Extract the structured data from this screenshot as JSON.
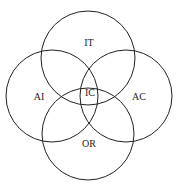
{
  "diagram": {
    "type": "venn",
    "sets": [
      {
        "id": "top",
        "label": "IT",
        "cx": 88,
        "cy": 58,
        "r": 47
      },
      {
        "id": "left",
        "label": "AI",
        "cx": 52,
        "cy": 96,
        "r": 46
      },
      {
        "id": "right",
        "label": "AC",
        "cx": 126,
        "cy": 96,
        "r": 46
      },
      {
        "id": "bottom",
        "label": "OR",
        "cx": 88,
        "cy": 134,
        "r": 46
      }
    ],
    "center_label": "IC",
    "labels": {
      "top": {
        "text": "IT",
        "x": 89,
        "y": 44
      },
      "left": {
        "text": "AI",
        "x": 39,
        "y": 98
      },
      "right": {
        "text": "AC",
        "x": 139,
        "y": 98
      },
      "bottom": {
        "text": "OR",
        "x": 89,
        "y": 145
      },
      "center": {
        "text": "IC",
        "x": 90,
        "y": 94
      }
    },
    "stroke_color": "#222222",
    "background": "#ffffff"
  }
}
